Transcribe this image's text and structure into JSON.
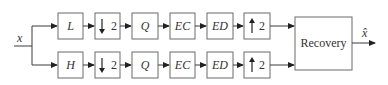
{
  "diagram": {
    "input_label": "x",
    "output_label": "x̂",
    "recovery_label": "Recovery",
    "branches": [
      {
        "name": "low",
        "blocks": [
          {
            "id": "filter",
            "label": "L"
          },
          {
            "id": "down",
            "label": "2",
            "arrow": "down"
          },
          {
            "id": "quant",
            "label": "Q"
          },
          {
            "id": "enc",
            "label": "EC"
          },
          {
            "id": "dec",
            "label": "ED"
          },
          {
            "id": "up",
            "label": "2",
            "arrow": "up"
          }
        ]
      },
      {
        "name": "high",
        "blocks": [
          {
            "id": "filter",
            "label": "H"
          },
          {
            "id": "down",
            "label": "2",
            "arrow": "down"
          },
          {
            "id": "quant",
            "label": "Q"
          },
          {
            "id": "enc",
            "label": "EC"
          },
          {
            "id": "dec",
            "label": "ED"
          },
          {
            "id": "up",
            "label": "2",
            "arrow": "up"
          }
        ]
      }
    ]
  }
}
